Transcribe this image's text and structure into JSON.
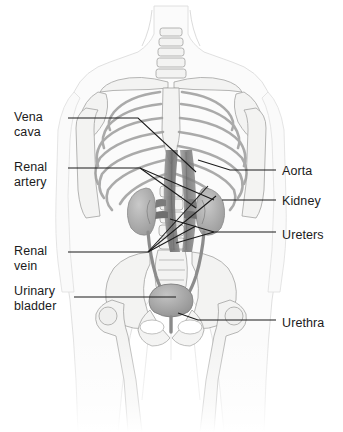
{
  "figure": {
    "background_color": "#ffffff",
    "width": 343,
    "height": 432
  },
  "style": {
    "leader_color": "#1a1a1a",
    "label_color": "#1b1b1b",
    "bone_fill": "#f2f2f1",
    "bone_stroke": "#9a9a99",
    "body_fill": "#fbfbfb",
    "body_stroke": "#d8d8d8",
    "vessel_fill": "#8e8e8e",
    "vessel_dark": "#6d6d6d",
    "organ_fill": "#b3b3b3"
  },
  "labels": {
    "left": [
      {
        "id": "vena-cava",
        "text": "Vena\ncava",
        "x": 14,
        "y": 110
      },
      {
        "id": "renal-artery",
        "text": "Renal\nartery",
        "x": 14,
        "y": 160
      },
      {
        "id": "renal-vein",
        "text": "Renal\nvein",
        "x": 14,
        "y": 244
      },
      {
        "id": "urinary-bladder",
        "text": "Urinary\nbladder",
        "x": 14,
        "y": 284
      }
    ],
    "right": [
      {
        "id": "aorta",
        "text": "Aorta",
        "x": 282,
        "y": 164
      },
      {
        "id": "kidney",
        "text": "Kidney",
        "x": 282,
        "y": 194
      },
      {
        "id": "ureters",
        "text": "Ureters",
        "x": 282,
        "y": 228
      },
      {
        "id": "urethra",
        "text": "Urethra",
        "x": 282,
        "y": 316
      }
    ]
  },
  "leaders": [
    {
      "id": "leader-vena-cava",
      "points": "68,118 138,118 196,172"
    },
    {
      "id": "leader-renal-artery",
      "points": "68,168 140,168 214,200"
    },
    {
      "id": "leader-renal-artery-b",
      "points": "140,168 196,208"
    },
    {
      "id": "leader-renal-vein",
      "points": "68,252 148,252 216,196"
    },
    {
      "id": "leader-renal-vein-b",
      "points": "148,252 208,186"
    },
    {
      "id": "leader-renal-vein-c",
      "points": "148,252 196,226"
    },
    {
      "id": "leader-bladder",
      "points": "74,297 176,297"
    },
    {
      "id": "leader-aorta",
      "points": "276,170 230,170 198,160"
    },
    {
      "id": "leader-kidney",
      "points": "276,200 222,200"
    },
    {
      "id": "leader-ureters",
      "points": "276,232 214,232 170,219"
    },
    {
      "id": "leader-ureters-b",
      "points": "214,232 176,243"
    },
    {
      "id": "leader-urethra",
      "points": "276,320 198,320 178,313"
    }
  ],
  "anatomy_parts": [
    {
      "id": "body-outline",
      "name": "torso-and-limbs-silhouette"
    },
    {
      "id": "neck",
      "name": "neck"
    },
    {
      "id": "cervical-spine",
      "name": "cervical-vertebrae"
    },
    {
      "id": "clavicle-left",
      "name": "left-clavicle"
    },
    {
      "id": "clavicle-right",
      "name": "right-clavicle"
    },
    {
      "id": "scapula-left",
      "name": "left-scapula"
    },
    {
      "id": "scapula-right",
      "name": "right-scapula"
    },
    {
      "id": "sternum",
      "name": "sternum"
    },
    {
      "id": "ribcage",
      "name": "ribcage"
    },
    {
      "id": "lumbar-spine",
      "name": "lumbar-vertebrae"
    },
    {
      "id": "pelvis",
      "name": "pelvic-girdle"
    },
    {
      "id": "sacrum",
      "name": "sacrum"
    },
    {
      "id": "femur-left",
      "name": "left-femur"
    },
    {
      "id": "femur-right",
      "name": "right-femur"
    },
    {
      "id": "humerus-left",
      "name": "left-humerus"
    },
    {
      "id": "humerus-right",
      "name": "right-humerus"
    },
    {
      "id": "aorta",
      "name": "abdominal-aorta"
    },
    {
      "id": "vena-cava",
      "name": "inferior-vena-cava"
    },
    {
      "id": "kidney-left",
      "name": "left-kidney"
    },
    {
      "id": "kidney-right",
      "name": "right-kidney"
    },
    {
      "id": "renal-artery-l",
      "name": "left-renal-artery"
    },
    {
      "id": "renal-artery-r",
      "name": "right-renal-artery"
    },
    {
      "id": "renal-vein-l",
      "name": "left-renal-vein"
    },
    {
      "id": "renal-vein-r",
      "name": "right-renal-vein"
    },
    {
      "id": "ureter-left",
      "name": "left-ureter"
    },
    {
      "id": "ureter-right",
      "name": "right-ureter"
    },
    {
      "id": "bladder",
      "name": "urinary-bladder"
    },
    {
      "id": "urethra",
      "name": "urethra"
    }
  ]
}
